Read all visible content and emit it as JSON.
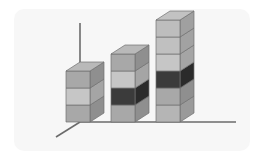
{
  "figure": {
    "title": "",
    "background_color": "#f7f7f7",
    "page_color": "#ffffff",
    "frame": {
      "x": 14,
      "y": 9,
      "width": 236,
      "height": 142,
      "corner_radius": 10
    }
  },
  "axes": {
    "line_color": "#6b6b6b",
    "line_width": 1.6,
    "vertical_axis": {
      "name": "y-axis",
      "x": 80,
      "y_top": 23,
      "y_bottom": 122
    },
    "horizontal_axis": {
      "name": "x-axis",
      "y": 122,
      "x_left": 80,
      "x_right": 236
    },
    "depth_axis": {
      "name": "z-axis",
      "x1": 80,
      "y1": 122,
      "x2": 56,
      "y2": 137
    }
  },
  "chart_data": {
    "type": "bar",
    "subtype": "3d-stacked-column",
    "title": "",
    "xlabel": "",
    "ylabel": "",
    "grid": false,
    "legend": "none",
    "categories": [
      "Bar 1",
      "Bar 2",
      "Bar 3"
    ],
    "ylim": [
      0,
      6
    ],
    "segment_unit_height": 17,
    "values": [
      3,
      4,
      6
    ],
    "series": [
      {
        "name": "Segment 1",
        "values": [
          1,
          1,
          1
        ]
      },
      {
        "name": "Segment 2",
        "values": [
          1,
          1,
          1
        ]
      },
      {
        "name": "Segment 3",
        "values": [
          1,
          1,
          1
        ]
      },
      {
        "name": "Segment 4",
        "values": [
          0,
          1,
          1
        ]
      },
      {
        "name": "Segment 5",
        "values": [
          0,
          0,
          1
        ]
      },
      {
        "name": "Segment 6",
        "values": [
          0,
          0,
          1
        ]
      }
    ],
    "bars": [
      {
        "label": "Bar 1",
        "segment_count": 3,
        "geometry": {
          "front_x": 66,
          "front_width": 24,
          "base_y": 122,
          "depth_dx": 14,
          "depth_dy": -9
        },
        "segments": [
          {
            "index": 1,
            "front_color": "#a8a8a8",
            "side_color": "#8f8f8f",
            "highlight": false
          },
          {
            "index": 2,
            "front_color": "#c6c6c6",
            "side_color": "#a5a5a5",
            "highlight": false
          },
          {
            "index": 3,
            "front_color": "#a8a8a8",
            "side_color": "#8f8f8f",
            "highlight": false
          }
        ],
        "top_face_color": "#b9b9b9"
      },
      {
        "label": "Bar 2",
        "segment_count": 4,
        "geometry": {
          "front_x": 111,
          "front_width": 24,
          "base_y": 122,
          "depth_dx": 14,
          "depth_dy": -9
        },
        "segments": [
          {
            "index": 1,
            "front_color": "#a8a8a8",
            "side_color": "#8f8f8f",
            "highlight": false
          },
          {
            "index": 2,
            "front_color": "#3b3b3b",
            "side_color": "#2b2b2b",
            "highlight": true
          },
          {
            "index": 3,
            "front_color": "#c6c6c6",
            "side_color": "#a5a5a5",
            "highlight": false
          },
          {
            "index": 4,
            "front_color": "#a8a8a8",
            "side_color": "#8f8f8f",
            "highlight": false
          }
        ],
        "top_face_color": "#b9b9b9"
      },
      {
        "label": "Bar 3",
        "segment_count": 6,
        "geometry": {
          "front_x": 156,
          "front_width": 24,
          "base_y": 122,
          "depth_dx": 14,
          "depth_dy": -9
        },
        "segments": [
          {
            "index": 1,
            "front_color": "#b5b5b5",
            "side_color": "#9a9a9a",
            "highlight": false
          },
          {
            "index": 2,
            "front_color": "#a8a8a8",
            "side_color": "#8f8f8f",
            "highlight": false
          },
          {
            "index": 3,
            "front_color": "#3b3b3b",
            "side_color": "#2b2b2b",
            "highlight": true
          },
          {
            "index": 4,
            "front_color": "#c6c6c6",
            "side_color": "#a5a5a5",
            "highlight": false
          },
          {
            "index": 5,
            "front_color": "#c0c0c0",
            "side_color": "#a2a2a2",
            "highlight": false
          },
          {
            "index": 6,
            "front_color": "#bdbdbd",
            "side_color": "#a0a0a0",
            "highlight": false
          }
        ],
        "top_face_color": "#c2c2c2"
      }
    ],
    "colors": {
      "front_light": "#c6c6c6",
      "front_mid": "#a8a8a8",
      "front_dark": "#3b3b3b",
      "side_light": "#a5a5a5",
      "side_mid": "#8f8f8f",
      "side_dark": "#2b2b2b",
      "top_face": "#b9b9b9",
      "edge": "#707070"
    }
  }
}
